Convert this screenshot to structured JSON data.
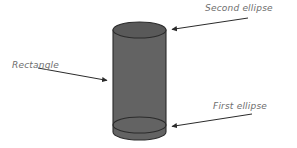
{
  "figure": {
    "background_color": "#ffffff",
    "shape": {
      "name": "cylinder",
      "body_fill": "#636363",
      "top_cap_fill": "#595959",
      "outline_color": "#2b2b2b",
      "left_edge_x": 113,
      "right_edge_x": 166,
      "top_y": 22,
      "bottom_y": 140,
      "ellipse_rx": 26.5,
      "ellipse_ry": 8
    },
    "annotation_color": "#333333",
    "labels": [
      {
        "id": "second-ellipse",
        "text": "Second ellipse",
        "arrow_from_x": 248,
        "arrow_from_y": 18,
        "arrow_to_x": 168,
        "arrow_to_y": 30
      },
      {
        "id": "rectangle",
        "text": "Rectangle",
        "arrow_from_x": 38,
        "arrow_from_y": 68,
        "arrow_to_x": 111,
        "arrow_to_y": 81
      },
      {
        "id": "first-ellipse",
        "text": "First ellipse",
        "arrow_from_x": 252,
        "arrow_from_y": 114,
        "arrow_to_x": 168,
        "arrow_to_y": 127
      }
    ]
  }
}
